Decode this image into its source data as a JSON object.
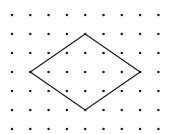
{
  "figure": {
    "type": "dot-grid-with-polygon",
    "background": "#ffffff",
    "grid": {
      "columns": 9,
      "rows": 7,
      "origin_x": 12,
      "origin_y": 15,
      "spacing_x": 18.3,
      "spacing_y": 19,
      "dot_radius": 1.3,
      "dot_color": "#222222"
    },
    "shape": {
      "name": "rhombus",
      "stroke_color": "#222222",
      "stroke_width": 1.3,
      "vertices_grid": [
        {
          "col": 4,
          "row": 1
        },
        {
          "col": 7,
          "row": 3
        },
        {
          "col": 4,
          "row": 5
        },
        {
          "col": 1,
          "row": 3
        }
      ]
    }
  }
}
